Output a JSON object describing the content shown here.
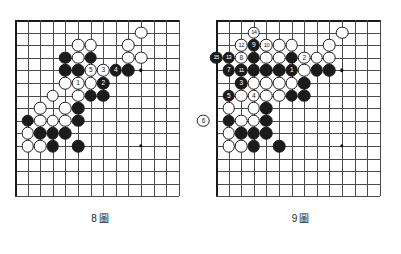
{
  "page": {
    "background": "#ffffff",
    "line_color": "#4a4a4a",
    "edge_color": "#1a1a1a",
    "black_stone_color": "#1b1b1b",
    "white_stone_color": "#ffffff"
  },
  "diagrams": [
    {
      "id": "diagram-8",
      "caption_number": "8",
      "caption_word": "圖",
      "board": {
        "cols": 14,
        "rows": 15,
        "cell": 12.6,
        "origin_x": 15,
        "origin_y": 20,
        "star_points": [
          {
            "c": 10,
            "r": 4
          },
          {
            "c": 10,
            "r": 10
          }
        ]
      },
      "stones": [
        {
          "c": 10,
          "r": 1,
          "color": "white",
          "label": ""
        },
        {
          "c": 5,
          "r": 2,
          "color": "white",
          "label": ""
        },
        {
          "c": 6,
          "r": 2,
          "color": "white",
          "label": ""
        },
        {
          "c": 9,
          "r": 2,
          "color": "white",
          "label": ""
        },
        {
          "c": 4,
          "r": 3,
          "color": "black",
          "label": ""
        },
        {
          "c": 5,
          "r": 3,
          "color": "white",
          "label": ""
        },
        {
          "c": 6,
          "r": 3,
          "color": "black",
          "label": ""
        },
        {
          "c": 9,
          "r": 3,
          "color": "white",
          "label": ""
        },
        {
          "c": 10,
          "r": 3,
          "color": "white",
          "label": ""
        },
        {
          "c": 4,
          "r": 4,
          "color": "black",
          "label": ""
        },
        {
          "c": 5,
          "r": 4,
          "color": "black",
          "label": ""
        },
        {
          "c": 6,
          "r": 4,
          "color": "white",
          "label": "5"
        },
        {
          "c": 7,
          "r": 4,
          "color": "white",
          "label": "3"
        },
        {
          "c": 8,
          "r": 4,
          "color": "black",
          "label": "4"
        },
        {
          "c": 9,
          "r": 4,
          "color": "black",
          "label": ""
        },
        {
          "c": 4,
          "r": 5,
          "color": "white",
          "label": ""
        },
        {
          "c": 5,
          "r": 5,
          "color": "white",
          "label": "1"
        },
        {
          "c": 6,
          "r": 5,
          "color": "white",
          "label": ""
        },
        {
          "c": 7,
          "r": 5,
          "color": "black",
          "label": "2"
        },
        {
          "c": 3,
          "r": 6,
          "color": "white",
          "label": ""
        },
        {
          "c": 5,
          "r": 6,
          "color": "white",
          "label": ""
        },
        {
          "c": 6,
          "r": 6,
          "color": "black",
          "label": ""
        },
        {
          "c": 7,
          "r": 6,
          "color": "black",
          "label": ""
        },
        {
          "c": 2,
          "r": 7,
          "color": "white",
          "label": ""
        },
        {
          "c": 4,
          "r": 7,
          "color": "white",
          "label": ""
        },
        {
          "c": 5,
          "r": 7,
          "color": "black",
          "label": ""
        },
        {
          "c": 1,
          "r": 8,
          "color": "black",
          "label": ""
        },
        {
          "c": 2,
          "r": 8,
          "color": "white",
          "label": ""
        },
        {
          "c": 3,
          "r": 8,
          "color": "white",
          "label": ""
        },
        {
          "c": 4,
          "r": 8,
          "color": "white",
          "label": ""
        },
        {
          "c": 5,
          "r": 8,
          "color": "black",
          "label": ""
        },
        {
          "c": 1,
          "r": 9,
          "color": "white",
          "label": ""
        },
        {
          "c": 2,
          "r": 9,
          "color": "black",
          "label": ""
        },
        {
          "c": 3,
          "r": 9,
          "color": "black",
          "label": ""
        },
        {
          "c": 4,
          "r": 9,
          "color": "black",
          "label": ""
        },
        {
          "c": 1,
          "r": 10,
          "color": "white",
          "label": ""
        },
        {
          "c": 2,
          "r": 10,
          "color": "white",
          "label": ""
        },
        {
          "c": 3,
          "r": 10,
          "color": "black",
          "label": ""
        },
        {
          "c": 5,
          "r": 10,
          "color": "black",
          "label": ""
        }
      ]
    },
    {
      "id": "diagram-9",
      "caption_number": "9",
      "caption_word": "圖",
      "board": {
        "cols": 14,
        "rows": 15,
        "cell": 12.6,
        "origin_x": 16,
        "origin_y": 20,
        "star_points": [
          {
            "c": 10,
            "r": 4
          },
          {
            "c": 10,
            "r": 10
          }
        ]
      },
      "stones": [
        {
          "c": 3,
          "r": 1,
          "color": "white",
          "label": "14"
        },
        {
          "c": 10,
          "r": 1,
          "color": "white",
          "label": ""
        },
        {
          "c": 2,
          "r": 2,
          "color": "white",
          "label": "12"
        },
        {
          "c": 3,
          "r": 2,
          "color": "black",
          "label": "9"
        },
        {
          "c": 4,
          "r": 2,
          "color": "white",
          "label": "10"
        },
        {
          "c": 5,
          "r": 2,
          "color": "white",
          "label": ""
        },
        {
          "c": 6,
          "r": 2,
          "color": "white",
          "label": ""
        },
        {
          "c": 9,
          "r": 2,
          "color": "white",
          "label": ""
        },
        {
          "c": 0,
          "r": 3,
          "color": "black",
          "label": "15"
        },
        {
          "c": 1,
          "r": 3,
          "color": "black",
          "label": "13"
        },
        {
          "c": 2,
          "r": 3,
          "color": "white",
          "label": "8"
        },
        {
          "c": 3,
          "r": 3,
          "color": "black",
          "label": ""
        },
        {
          "c": 4,
          "r": 3,
          "color": "white",
          "label": ""
        },
        {
          "c": 5,
          "r": 3,
          "color": "white",
          "label": ""
        },
        {
          "c": 6,
          "r": 3,
          "color": "black",
          "label": ""
        },
        {
          "c": 7,
          "r": 3,
          "color": "white",
          "label": "2"
        },
        {
          "c": 8,
          "r": 3,
          "color": "white",
          "label": ""
        },
        {
          "c": 9,
          "r": 3,
          "color": "white",
          "label": ""
        },
        {
          "c": 1,
          "r": 4,
          "color": "black",
          "label": "7"
        },
        {
          "c": 2,
          "r": 4,
          "color": "black",
          "label": "11"
        },
        {
          "c": 3,
          "r": 4,
          "color": "black",
          "label": ""
        },
        {
          "c": 4,
          "r": 4,
          "color": "black",
          "label": ""
        },
        {
          "c": 5,
          "r": 4,
          "color": "black",
          "label": ""
        },
        {
          "c": 6,
          "r": 4,
          "color": "black",
          "label": "1"
        },
        {
          "c": 7,
          "r": 4,
          "color": "white",
          "label": ""
        },
        {
          "c": 8,
          "r": 4,
          "color": "black",
          "label": ""
        },
        {
          "c": 9,
          "r": 4,
          "color": "black",
          "label": ""
        },
        {
          "c": 2,
          "r": 5,
          "color": "black",
          "label": "3"
        },
        {
          "c": 3,
          "r": 5,
          "color": "white",
          "label": ""
        },
        {
          "c": 4,
          "r": 5,
          "color": "white",
          "label": ""
        },
        {
          "c": 5,
          "r": 5,
          "color": "white",
          "label": ""
        },
        {
          "c": 6,
          "r": 5,
          "color": "white",
          "label": ""
        },
        {
          "c": 7,
          "r": 5,
          "color": "black",
          "label": ""
        },
        {
          "c": 1,
          "r": 6,
          "color": "black",
          "label": "5"
        },
        {
          "c": 2,
          "r": 6,
          "color": "white",
          "label": ""
        },
        {
          "c": 3,
          "r": 6,
          "color": "white",
          "label": "4"
        },
        {
          "c": 4,
          "r": 6,
          "color": "white",
          "label": ""
        },
        {
          "c": 5,
          "r": 6,
          "color": "white",
          "label": ""
        },
        {
          "c": 6,
          "r": 6,
          "color": "black",
          "label": ""
        },
        {
          "c": 7,
          "r": 6,
          "color": "black",
          "label": ""
        },
        {
          "c": 1,
          "r": 7,
          "color": "white",
          "label": ""
        },
        {
          "c": 3,
          "r": 7,
          "color": "white",
          "label": ""
        },
        {
          "c": 4,
          "r": 7,
          "color": "black",
          "label": ""
        },
        {
          "c": -1,
          "r": 8,
          "color": "white",
          "label": "6"
        },
        {
          "c": 1,
          "r": 8,
          "color": "black",
          "label": ""
        },
        {
          "c": 2,
          "r": 8,
          "color": "white",
          "label": ""
        },
        {
          "c": 3,
          "r": 8,
          "color": "white",
          "label": ""
        },
        {
          "c": 4,
          "r": 8,
          "color": "black",
          "label": ""
        },
        {
          "c": 1,
          "r": 9,
          "color": "white",
          "label": ""
        },
        {
          "c": 2,
          "r": 9,
          "color": "black",
          "label": ""
        },
        {
          "c": 3,
          "r": 9,
          "color": "black",
          "label": ""
        },
        {
          "c": 4,
          "r": 9,
          "color": "black",
          "label": ""
        },
        {
          "c": 1,
          "r": 10,
          "color": "white",
          "label": ""
        },
        {
          "c": 2,
          "r": 10,
          "color": "white",
          "label": ""
        },
        {
          "c": 3,
          "r": 10,
          "color": "black",
          "label": ""
        },
        {
          "c": 5,
          "r": 10,
          "color": "black",
          "label": ""
        }
      ]
    }
  ]
}
